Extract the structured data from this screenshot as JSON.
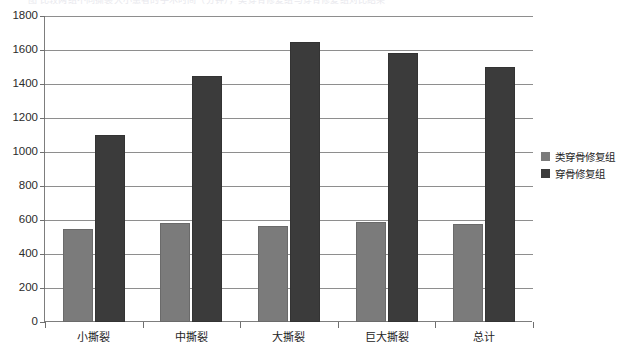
{
  "cutoff_title": "图 比较两组不同撕裂大小患者的手术时间（分钟），类穿骨修复组与穿骨修复组对比结果",
  "chart_data": {
    "type": "bar",
    "title": "",
    "subtitle": "",
    "xlabel": "",
    "ylabel": "",
    "categories": [
      "小撕裂",
      "中撕裂",
      "大撕裂",
      "巨大撕裂",
      "总计"
    ],
    "series": [
      {
        "name": "类穿骨修复组",
        "color": "#7b7b7b",
        "values": [
          550,
          580,
          565,
          590,
          578
        ]
      },
      {
        "name": "穿骨修复组",
        "color": "#3b3b3b",
        "values": [
          1100,
          1450,
          1650,
          1580,
          1500
        ]
      }
    ],
    "ylim": [
      0,
      1800
    ],
    "ytick_step": 200,
    "yticks": [
      0,
      200,
      400,
      600,
      800,
      1000,
      1200,
      1400,
      1600,
      1800
    ],
    "ytick_labels": [
      "0",
      "200",
      "400",
      "600",
      "800",
      "1000",
      "1200",
      "1400",
      "1600",
      "1800"
    ],
    "grid": true,
    "grid_axis": "y",
    "legend_position": "right",
    "legend_entries": [
      "类穿骨修复组",
      "穿骨修复组"
    ],
    "annotations": []
  }
}
